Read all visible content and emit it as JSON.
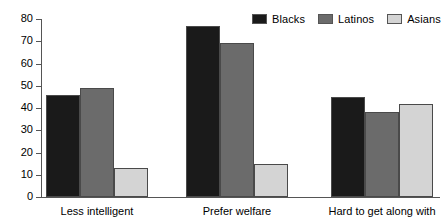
{
  "chart_data": {
    "type": "bar",
    "title": "",
    "xlabel": "",
    "ylabel": "",
    "ylim": [
      0,
      80
    ],
    "yticks": [
      0,
      10,
      20,
      30,
      40,
      50,
      60,
      70,
      80
    ],
    "grid": false,
    "legend_position": "top-right",
    "categories": [
      "Less intelligent",
      "Prefer welfare",
      "Hard to get along with"
    ],
    "series": [
      {
        "name": "Blacks",
        "color": "#1a1a1a",
        "values": [
          46,
          77,
          45
        ]
      },
      {
        "name": "Latinos",
        "color": "#6b6b6b",
        "values": [
          49,
          69,
          38
        ]
      },
      {
        "name": "Asians",
        "color": "#d4d4d4",
        "values": [
          13,
          15,
          42
        ]
      }
    ]
  },
  "axis": {
    "tick_labels": [
      "0",
      "10",
      "20",
      "30",
      "40",
      "50",
      "60",
      "70",
      "80"
    ]
  },
  "legend": {
    "items": [
      {
        "label": "Blacks",
        "swatch": "#1a1a1a"
      },
      {
        "label": "Latinos",
        "swatch": "#6b6b6b"
      },
      {
        "label": "Asians",
        "swatch": "#d4d4d4"
      }
    ]
  },
  "colors": {
    "blacks": "#1a1a1a",
    "latinos": "#6b6b6b",
    "asians": "#d4d4d4",
    "axis": "#555555",
    "background": "#ffffff"
  }
}
